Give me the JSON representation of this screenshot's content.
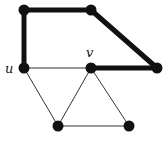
{
  "diagram": {
    "type": "graph",
    "nodes": [
      {
        "id": "a",
        "x": 24,
        "y": 10,
        "label": ""
      },
      {
        "id": "b",
        "x": 91,
        "y": 10,
        "label": ""
      },
      {
        "id": "c",
        "x": 157,
        "y": 68,
        "label": ""
      },
      {
        "id": "u",
        "x": 24,
        "y": 68,
        "label": "u"
      },
      {
        "id": "v",
        "x": 91,
        "y": 68,
        "label": "v"
      },
      {
        "id": "d",
        "x": 58,
        "y": 126,
        "label": ""
      },
      {
        "id": "e",
        "x": 129,
        "y": 126,
        "label": ""
      }
    ],
    "edges": [
      {
        "from": "u",
        "to": "a",
        "bold": true
      },
      {
        "from": "a",
        "to": "b",
        "bold": true
      },
      {
        "from": "b",
        "to": "c",
        "bold": true
      },
      {
        "from": "c",
        "to": "v",
        "bold": true
      },
      {
        "from": "u",
        "to": "v",
        "bold": false
      },
      {
        "from": "u",
        "to": "d",
        "bold": false
      },
      {
        "from": "v",
        "to": "d",
        "bold": false
      },
      {
        "from": "v",
        "to": "e",
        "bold": false
      },
      {
        "from": "d",
        "to": "e",
        "bold": false
      }
    ],
    "labels": {
      "u": "u",
      "v": "v"
    }
  }
}
